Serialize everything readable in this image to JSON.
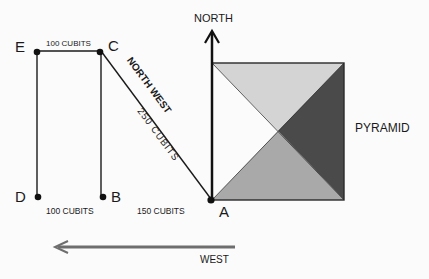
{
  "points": {
    "A": "A",
    "B": "B",
    "C": "C",
    "D": "D",
    "E": "E"
  },
  "labels": {
    "north": "NORTH",
    "west": "WEST",
    "pyramid": "PYRAMID",
    "ec_distance": "100 CUBITS",
    "db_distance": "100 CUBITS",
    "ba_distance": "150 CUBITS",
    "ca_direction": "NORTH WEST",
    "ca_distance": "250 CUBITS"
  },
  "colors": {
    "background": "#fbfbfb",
    "ink": "#1a1a1a",
    "face_top": "#d4d4d4",
    "face_right": "#4a4a4a",
    "face_bottom": "#a9a9a9",
    "face_left": "#fbfbfb",
    "west_arrow": "#6e6e6e"
  }
}
